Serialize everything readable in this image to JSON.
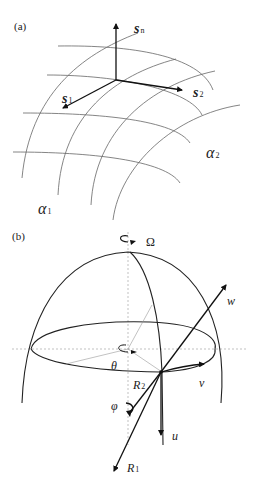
{
  "panel_a": {
    "label": "(a)",
    "vectors": {
      "sn": {
        "main": "s",
        "sub": "n"
      },
      "s1": {
        "main": "s",
        "sub": "1"
      },
      "s2": {
        "main": "s",
        "sub": "2"
      }
    },
    "surface_labels": {
      "alpha1": {
        "main": "α",
        "sub": "1"
      },
      "alpha2": {
        "main": "α",
        "sub": "2"
      }
    }
  },
  "panel_b": {
    "label": "(b)",
    "rotation": "Ω",
    "theta": "θ",
    "phi": "φ",
    "R1": {
      "main": "R",
      "sub": "1"
    },
    "R2": {
      "main": "R",
      "sub": "2"
    },
    "u": "u",
    "v": "v",
    "w": "w"
  }
}
